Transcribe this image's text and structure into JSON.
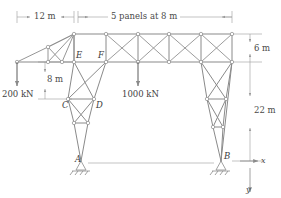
{
  "figure": {
    "stroke_color": "#7b7b7b",
    "member_color": "#8a8a8a",
    "dim_color": "#9a9a9a",
    "text_color": "#3a3a3a"
  },
  "dimensions": [
    {
      "id": "span-left",
      "label": "12 m",
      "orientation": "horizontal"
    },
    {
      "id": "span-panels",
      "label": "5 panels at 8 m",
      "orientation": "horizontal"
    },
    {
      "id": "depth-top",
      "label": "6 m",
      "orientation": "vertical"
    },
    {
      "id": "height-tower",
      "label": "22 m",
      "orientation": "vertical"
    },
    {
      "id": "drop-ef-cd",
      "label": "8 m",
      "orientation": "vertical"
    }
  ],
  "loads": [
    {
      "id": "load-left",
      "label": "200 kN",
      "direction": "down"
    },
    {
      "id": "load-mid",
      "label": "1000 kN",
      "direction": "down"
    }
  ],
  "nodes": [
    {
      "id": "node-A",
      "label": "A"
    },
    {
      "id": "node-B",
      "label": "B"
    },
    {
      "id": "node-C",
      "label": "C"
    },
    {
      "id": "node-D",
      "label": "D"
    },
    {
      "id": "node-E",
      "label": "E"
    },
    {
      "id": "node-F",
      "label": "F"
    }
  ],
  "axes": [
    {
      "id": "axis-x",
      "label": "x",
      "direction": "right"
    },
    {
      "id": "axis-y",
      "label": "y",
      "direction": "down"
    }
  ],
  "supports": [
    {
      "id": "support-A",
      "type": "pin"
    },
    {
      "id": "support-B",
      "type": "pin"
    }
  ]
}
